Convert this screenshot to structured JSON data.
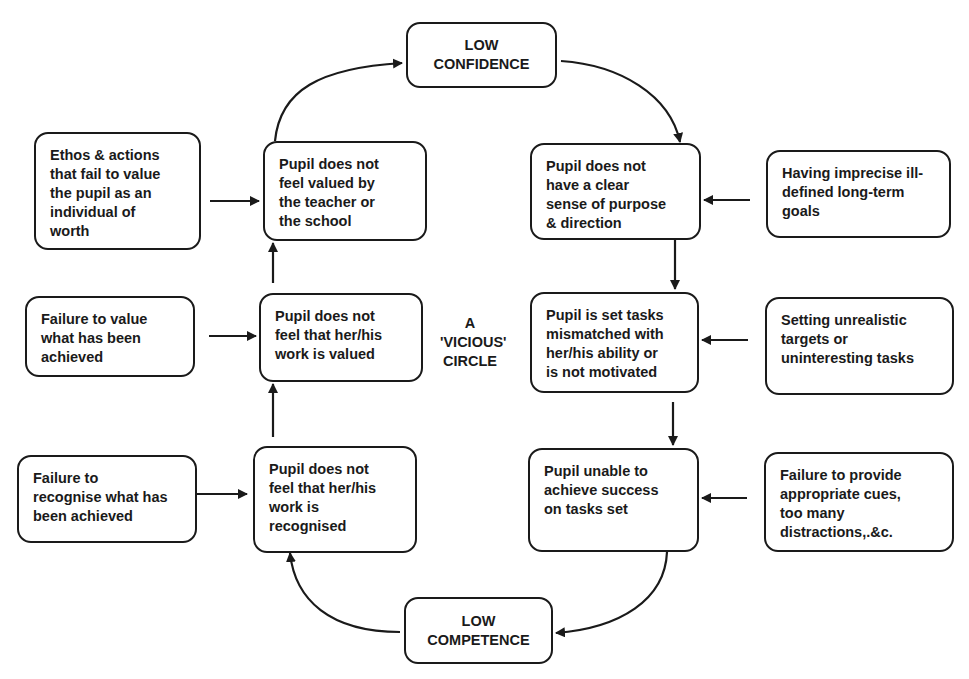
{
  "diagram": {
    "center_label": "A\n'VICIOUS'\nCIRCLE",
    "states": {
      "low_confidence": "LOW\nCONFIDENCE",
      "low_competence": "LOW\nCOMPETENCE"
    },
    "cycle_nodes": [
      {
        "id": "not_valued_by_teacher",
        "text": "Pupil does not\nfeel valued by\nthe teacher or\nthe school"
      },
      {
        "id": "no_clear_purpose",
        "text": "Pupil does not\nhave a clear\nsense of purpose\n& direction"
      },
      {
        "id": "mismatched_tasks",
        "text": "Pupil is set tasks\nmismatched with\nher/his ability or\nis not motivated"
      },
      {
        "id": "unable_to_succeed",
        "text": "Pupil unable to\nachieve success\non tasks set"
      },
      {
        "id": "work_not_recognised",
        "text": "Pupil does not\nfeel that her/his\nwork is\nrecognised"
      },
      {
        "id": "work_not_valued",
        "text": "Pupil does not\nfeel that her/his\nwork is valued"
      }
    ],
    "causes": [
      {
        "target": "not_valued_by_teacher",
        "text": "Ethos & actions\nthat fail to value\nthe pupil as an\nindividual of\nworth"
      },
      {
        "target": "work_not_valued",
        "text": "Failure to value\nwhat has been\nachieved"
      },
      {
        "target": "work_not_recognised",
        "text": "Failure to\nrecognise what has\nbeen achieved"
      },
      {
        "target": "no_clear_purpose",
        "text": "Having imprecise ill-\ndefined long-term\ngoals"
      },
      {
        "target": "mismatched_tasks",
        "text": "Setting unrealistic\ntargets or\nuninteresting tasks"
      },
      {
        "target": "unable_to_succeed",
        "text": "Failure to provide\nappropriate cues,\ntoo many\ndistractions,.&c."
      }
    ],
    "flow": [
      "LOW CONFIDENCE -> no_clear_purpose",
      "no_clear_purpose -> mismatched_tasks",
      "mismatched_tasks -> unable_to_succeed",
      "unable_to_succeed -> LOW COMPETENCE",
      "LOW COMPETENCE -> work_not_recognised",
      "work_not_recognised -> work_not_valued",
      "work_not_valued -> not_valued_by_teacher",
      "not_valued_by_teacher -> LOW CONFIDENCE"
    ],
    "colors": {
      "stroke": "#1a1a1a",
      "background": "#ffffff"
    }
  }
}
